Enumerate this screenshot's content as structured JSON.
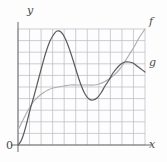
{
  "figure": {
    "background_color": "#fdfdfd",
    "width": 167,
    "height": 162
  },
  "labels": {
    "y_axis": "y",
    "x_axis": "x",
    "origin": "0",
    "curve_f": "f",
    "curve_g": "g"
  },
  "colors": {
    "grid": "#b9b9c4",
    "axis": "#6b6b6b",
    "curve_f": "#5a5a5a",
    "curve_g": "#b0b0b0",
    "label": "#4a4a4a"
  },
  "chart_data": {
    "type": "line",
    "title": "",
    "xlabel": "x",
    "ylabel": "y",
    "grid": true,
    "legend": "inline-right-labels",
    "axis_ranges": {
      "xlim": [
        0,
        11
      ],
      "ylim": [
        0,
        10
      ]
    },
    "grid_spec": {
      "x_divisions": 11,
      "y_divisions": 10,
      "cell_width_px": 11.55,
      "cell_height_px": 11.6,
      "plot_box_px": {
        "left": 18,
        "top": 29,
        "right": 145,
        "bottom": 145
      }
    },
    "series": [
      {
        "name": "f",
        "label": "f",
        "color": "#5a5a5a",
        "stroke_width": 1.2,
        "description": "steeply rising curve with a tall first maximum, a local minimum, then a second lower maximum",
        "features": {
          "start": [
            0,
            0
          ],
          "first_maximum": [
            3.4,
            9.8
          ],
          "local_minimum": [
            6.5,
            3.9
          ],
          "second_maximum": [
            9.3,
            7.2
          ],
          "end": [
            11,
            6.3
          ]
        },
        "points_px": [
          [
            18,
            145
          ],
          [
            21,
            141
          ],
          [
            24,
            133
          ],
          [
            27,
            122
          ],
          [
            30,
            110
          ],
          [
            34,
            96
          ],
          [
            38,
            81
          ],
          [
            42,
            66
          ],
          [
            46,
            52
          ],
          [
            50,
            41
          ],
          [
            54,
            34
          ],
          [
            57,
            31
          ],
          [
            61,
            32
          ],
          [
            65,
            38
          ],
          [
            69,
            48
          ],
          [
            73,
            60
          ],
          [
            77,
            73
          ],
          [
            81,
            85
          ],
          [
            85,
            94
          ],
          [
            89,
            99
          ],
          [
            93,
            100
          ],
          [
            97,
            98
          ],
          [
            101,
            93
          ],
          [
            105,
            86
          ],
          [
            109,
            80
          ],
          [
            113,
            73
          ],
          [
            117,
            68
          ],
          [
            121,
            64
          ],
          [
            125,
            62
          ],
          [
            129,
            62
          ],
          [
            133,
            63
          ],
          [
            137,
            66
          ],
          [
            141,
            69
          ],
          [
            145,
            72
          ]
        ]
      },
      {
        "name": "g",
        "label": "g",
        "color": "#b0b0b0",
        "stroke_width": 1.2,
        "description": "concave-down rise to a broad plateau, then an upward sweep at the right edge",
        "features": {
          "start": [
            0,
            1.3
          ],
          "plateau_level": [
            5.8,
            5.2
          ],
          "end": [
            11,
            10.0
          ]
        },
        "points_px": [
          [
            18,
            130
          ],
          [
            22,
            122
          ],
          [
            26,
            114
          ],
          [
            30,
            107
          ],
          [
            34,
            101
          ],
          [
            38,
            97
          ],
          [
            43,
            93
          ],
          [
            48,
            90
          ],
          [
            53,
            88
          ],
          [
            58,
            87
          ],
          [
            64,
            86
          ],
          [
            70,
            85
          ],
          [
            76,
            85
          ],
          [
            82,
            85
          ],
          [
            88,
            85
          ],
          [
            94,
            85
          ],
          [
            99,
            84
          ],
          [
            104,
            82
          ],
          [
            109,
            79
          ],
          [
            114,
            75
          ],
          [
            119,
            70
          ],
          [
            124,
            63
          ],
          [
            129,
            55
          ],
          [
            134,
            47
          ],
          [
            139,
            38
          ],
          [
            145,
            29
          ]
        ]
      }
    ]
  }
}
